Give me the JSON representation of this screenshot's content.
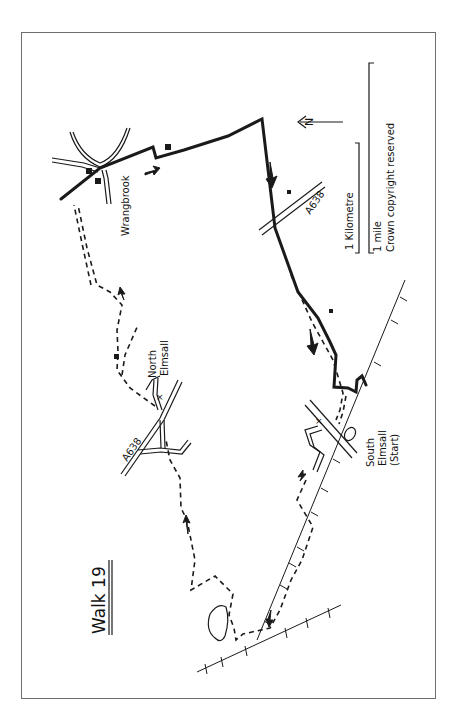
{
  "map": {
    "title": "Walk 19",
    "north_label": "N",
    "scale": {
      "kilometre_label": "1 Kilometre",
      "mile_label": "1 mile",
      "copyright": "Crown copyright reserved"
    },
    "places": {
      "wrangbrook": "Wrangbrook",
      "north_elmsall_1": "North",
      "north_elmsall_2": "Elmsall",
      "south_elmsall_1": "South",
      "south_elmsall_2": "Elmsall",
      "start": "(Start)"
    },
    "roads": {
      "a638_east": "A638",
      "a638_west": "A638"
    },
    "colors": {
      "ink": "#1a1a1a",
      "frame": "#6e6e6e",
      "paper": "#ffffff"
    }
  }
}
